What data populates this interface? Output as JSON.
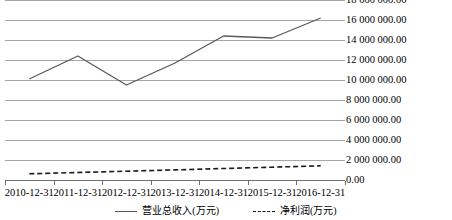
{
  "chart_data": {
    "type": "line",
    "title": "",
    "xlabel": "",
    "ylabel": "",
    "categories": [
      "2010-12-31",
      "2011-12-31",
      "2012-12-31",
      "2013-12-31",
      "2014-12-31",
      "2015-12-31",
      "2016-12-31"
    ],
    "series": [
      {
        "name": "营业总收入(万元)",
        "style": "solid",
        "color": "#595959",
        "values": [
          10100000.0,
          12400000.0,
          9500000.0,
          11700000.0,
          14400000.0,
          14200000.0,
          16200000.0
        ]
      },
      {
        "name": "净利润(万元)",
        "style": "dashed",
        "color": "#1a1a1a",
        "values": [
          620000.0,
          750000.0,
          880000.0,
          1010000.0,
          1150000.0,
          1280000.0,
          1420000.0
        ]
      }
    ],
    "ylim": [
      0,
      18000000
    ],
    "ytick_values": [
      18000000,
      16000000,
      14000000,
      12000000,
      10000000,
      8000000,
      6000000,
      4000000,
      2000000,
      0
    ],
    "ytick_labels": [
      "18 000 000.00",
      "16 000 000.00",
      "14 000 000.00",
      "12 000 000.00",
      "10 000 000.00",
      "8 000 000.00",
      "6 000 000.00",
      "4 000 000.00",
      "2 000 000.00",
      "0.00"
    ],
    "grid": true,
    "grid_color": "#a6a6a6",
    "legend_position": "bottom",
    "background": "#ffffff"
  }
}
